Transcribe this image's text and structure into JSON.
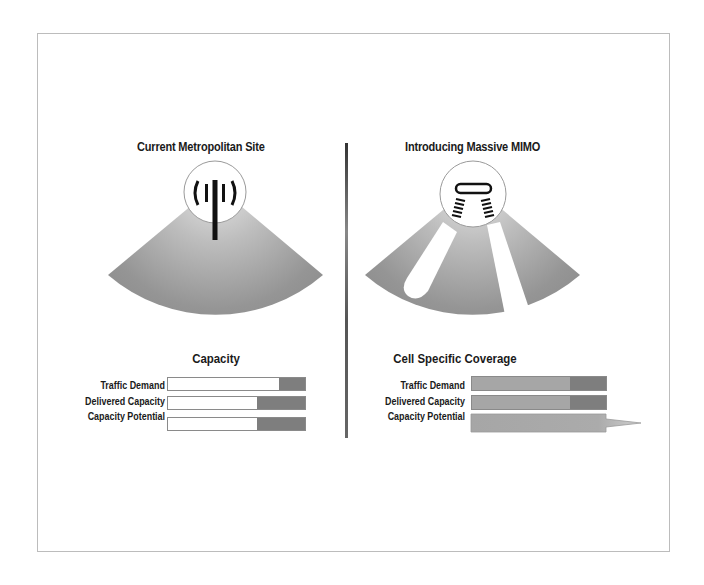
{
  "left_panel": {
    "title": "Current Metropolitan Site",
    "icon": "cell-tower-antenna-icon",
    "caption": "Capacity",
    "bars": [
      {
        "label": "Traffic Demand",
        "white_pct": 81,
        "dark_pct": 19
      },
      {
        "label": "Delivered Capacity",
        "white_pct": 71,
        "dark_pct": 29
      },
      {
        "label": "Capacity Potential",
        "white_pct": 71,
        "dark_pct": 29
      }
    ]
  },
  "right_panel": {
    "title": "Introducing Massive MIMO",
    "icon": "massive-mimo-array-icon",
    "caption": "Cell Specific Coverage",
    "bars": [
      {
        "label": "Traffic Demand",
        "fill_pct": 73,
        "dark_pct": 27
      },
      {
        "label": "Delivered Capacity",
        "fill_pct": 73,
        "dark_pct": 27
      },
      {
        "label": "Capacity Potential",
        "fill_pct": 100,
        "arrow": true
      }
    ]
  },
  "colors": {
    "frame_border": "#bcbcbc",
    "sector_light": "#c4c4c4",
    "sector_dark": "#8c8c8c",
    "bar_dark": "#7e7e7e",
    "bar_mid": "#a6a6a6"
  }
}
